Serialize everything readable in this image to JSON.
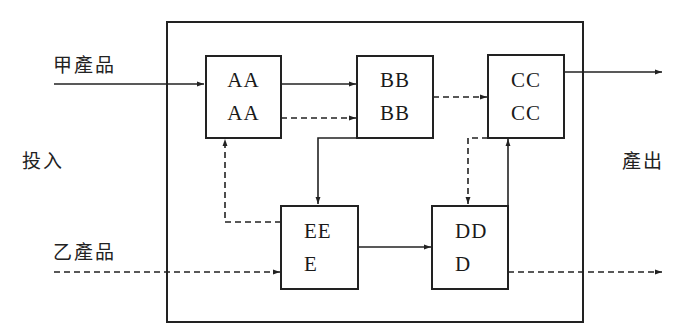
{
  "diagram": {
    "side_labels": {
      "input": "投入",
      "output": "產出"
    },
    "inputs": [
      {
        "id": "product-a",
        "label": "甲產品",
        "line_style": "solid",
        "target": "AA"
      },
      {
        "id": "product-b",
        "label": "乙產品",
        "line_style": "dashed",
        "target": "EE"
      }
    ],
    "nodes": [
      {
        "id": "AA",
        "lines": [
          "AA",
          "AA"
        ]
      },
      {
        "id": "BB",
        "lines": [
          "BB",
          "BB"
        ]
      },
      {
        "id": "CC",
        "lines": [
          "CC",
          "CC"
        ]
      },
      {
        "id": "DD",
        "lines": [
          "DD",
          "D"
        ]
      },
      {
        "id": "EE",
        "lines": [
          "EE",
          "E"
        ]
      }
    ],
    "edges": [
      {
        "from": "input:甲產品",
        "to": "AA",
        "style": "solid"
      },
      {
        "from": "AA",
        "to": "BB",
        "style": "solid"
      },
      {
        "from": "AA",
        "to": "BB",
        "style": "dashed"
      },
      {
        "from": "BB",
        "to": "CC",
        "style": "dashed"
      },
      {
        "from": "BB",
        "to": "EE",
        "style": "solid"
      },
      {
        "from": "EE",
        "to": "AA",
        "style": "dashed"
      },
      {
        "from": "input:乙產品",
        "to": "EE",
        "style": "dashed"
      },
      {
        "from": "EE",
        "to": "DD",
        "style": "solid"
      },
      {
        "from": "CC",
        "to": "DD",
        "style": "dashed"
      },
      {
        "from": "DD",
        "to": "CC",
        "style": "solid"
      },
      {
        "from": "CC",
        "to": "output",
        "style": "solid"
      },
      {
        "from": "DD",
        "to": "output",
        "style": "dashed"
      }
    ],
    "colors": {
      "stroke": "#222222",
      "background": "#ffffff"
    }
  }
}
